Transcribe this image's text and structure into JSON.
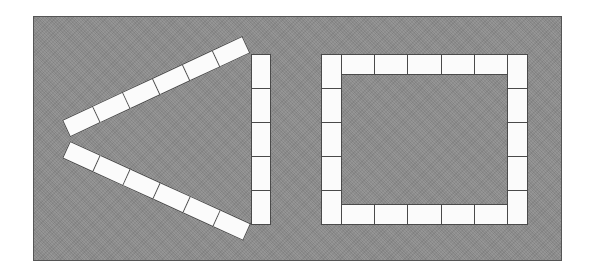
{
  "figure": {
    "background_color": "#8b8b8b",
    "tile_color": "#fbfbfb",
    "tile_border_color": "#4a4a4a",
    "shapes": [
      {
        "name": "triangle",
        "description": "Three rows of tiles arranged as a triangle",
        "sides": [
          {
            "position": "top-arm",
            "tiles": 6
          },
          {
            "position": "bottom-arm",
            "tiles": 6
          },
          {
            "position": "right-vertical",
            "tiles": 5
          }
        ],
        "total_tiles": 17
      },
      {
        "name": "square",
        "description": "Tiles arranged as a rectangular frame",
        "sides": [
          {
            "position": "top",
            "tiles": 5
          },
          {
            "position": "bottom",
            "tiles": 5
          },
          {
            "position": "left",
            "tiles": 5
          },
          {
            "position": "right",
            "tiles": 5
          }
        ],
        "total_tiles": 20
      }
    ]
  }
}
